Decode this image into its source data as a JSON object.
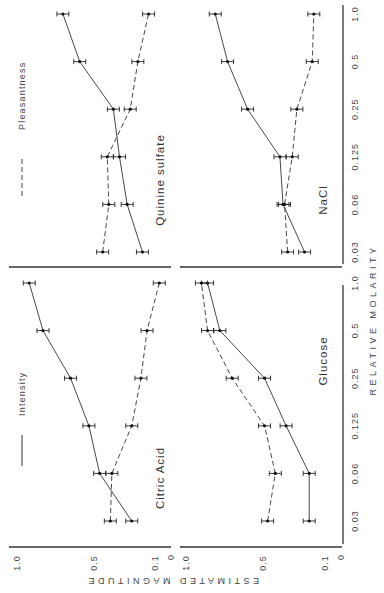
{
  "chart_data": {
    "type": "line",
    "orientation_note": "figure rotated 90 degrees counterclockwise on page",
    "xlabel": "RELATIVE MOLARITY",
    "ylabel": "ESTIMATED MAGNITUDE",
    "x_categories": [
      "0.03",
      "0.06",
      "0.125",
      "0.25",
      "0.5",
      "1.0"
    ],
    "y_ticks": [
      "1.0",
      "0.5",
      "0.1",
      "0"
    ],
    "ylim": [
      0,
      1.0
    ],
    "legend": [
      {
        "name": "Intensity",
        "style": "solid"
      },
      {
        "name": "Pleasantness",
        "style": "dashed"
      }
    ],
    "panels": [
      {
        "title": "Citric Acid",
        "series": [
          {
            "name": "Intensity",
            "values": [
              0.25,
              0.46,
              0.53,
              0.65,
              0.83,
              0.92
            ]
          },
          {
            "name": "Pleasantness",
            "values": [
              0.39,
              0.38,
              0.25,
              0.19,
              0.15,
              0.07
            ]
          }
        ]
      },
      {
        "title": "Glucose",
        "series": [
          {
            "name": "Intensity",
            "values": [
              0.2,
              0.2,
              0.35,
              0.49,
              0.78,
              0.86
            ]
          },
          {
            "name": "Pleasantness",
            "values": [
              0.47,
              0.42,
              0.49,
              0.7,
              0.86,
              0.9
            ]
          }
        ]
      },
      {
        "title": "Quinine sulfate",
        "series": [
          {
            "name": "Intensity",
            "values": [
              0.18,
              0.28,
              0.33,
              0.37,
              0.59,
              0.7
            ]
          },
          {
            "name": "Pleasantness",
            "values": [
              0.44,
              0.4,
              0.41,
              0.26,
              0.21,
              0.14
            ]
          }
        ]
      },
      {
        "title": "NaCl",
        "series": [
          {
            "name": "Intensity",
            "values": [
              0.23,
              0.37,
              0.39,
              0.6,
              0.73,
              0.81
            ]
          },
          {
            "name": "Pleasantness",
            "values": [
              0.34,
              0.36,
              0.31,
              0.28,
              0.18,
              0.17
            ]
          }
        ]
      }
    ]
  },
  "labels": {
    "legend_intensity": "Intensity",
    "legend_pleasantness": "Pleasantness",
    "panel_citric": "Citric Acid",
    "panel_glucose": "Glucose",
    "panel_quinine": "Quinine sulfate",
    "panel_nacl": "NaCl",
    "xlabel": "RELATIVE MOLARITY",
    "ylabel": "ESTIMATED MAGNITUDE"
  }
}
